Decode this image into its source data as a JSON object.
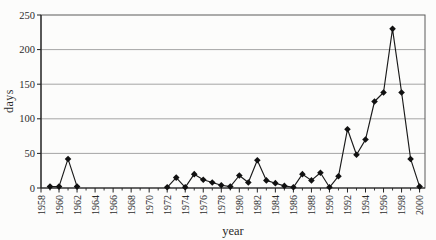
{
  "chart_data": {
    "type": "line",
    "title": "",
    "xlabel": "year",
    "ylabel": "days",
    "xlim": [
      1958,
      2000.6
    ],
    "ylim": [
      0,
      250
    ],
    "yticks": [
      0,
      50,
      100,
      150,
      200,
      250
    ],
    "xticks_major": [
      1958,
      1960,
      1962,
      1964,
      1966,
      1968,
      1970,
      1972,
      1974,
      1976,
      1978,
      1980,
      1982,
      1984,
      1986,
      1988,
      1990,
      1992,
      1994,
      1996,
      1998,
      2000
    ],
    "xticks_minor": [
      1959,
      1961,
      1963,
      1965,
      1967,
      1969,
      1971,
      1973,
      1975,
      1977,
      1979,
      1981,
      1983,
      1985,
      1987,
      1989,
      1991,
      1993,
      1995,
      1997,
      1999
    ],
    "grid": "horizontal gridlines at each 50",
    "legend_position": "none",
    "marker": "filled-diamond",
    "colors": {
      "line": "#1a1a1a",
      "marker": "#111111",
      "grid": "#8f8f8f",
      "frame": "#5a5a5a",
      "axis": "#222222",
      "text": "#2b2b2b",
      "background": "#fcfcfb"
    },
    "series": [
      {
        "name": "days",
        "segments": [
          {
            "x": [
              1959,
              1960,
              1961,
              1962
            ],
            "y": [
              2,
              2,
              42,
              2
            ]
          },
          {
            "x": [
              1972,
              1973,
              1974,
              1975,
              1976,
              1977,
              1978,
              1979,
              1980,
              1981,
              1982,
              1983,
              1984,
              1985,
              1986,
              1987,
              1988,
              1989,
              1990,
              1991,
              1992,
              1993,
              1994,
              1995,
              1996,
              1997,
              1998,
              1999,
              2000
            ],
            "y": [
              1,
              15,
              1,
              20,
              12,
              8,
              4,
              2,
              18,
              8,
              40,
              11,
              7,
              3,
              1,
              20,
              11,
              22,
              1,
              17,
              85,
              48,
              70,
              125,
              138,
              230,
              138,
              42,
              2
            ]
          }
        ]
      }
    ]
  }
}
